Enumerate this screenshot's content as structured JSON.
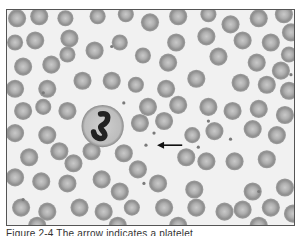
{
  "figure": {
    "type": "peripheral-blood-smear-micrograph",
    "background_color": "#f1f1f1",
    "rbc_color": "#9a9a9a",
    "rbc_center_color": "#c8c8c8",
    "nucleus_color": "#222222",
    "arrow": {
      "from": [
        174,
        134
      ],
      "to": [
        149,
        134
      ],
      "color": "#111111"
    },
    "platelet_highlighted": [
      138,
      134
    ],
    "neutrophil": {
      "cx": 95,
      "cy": 115,
      "r": 21
    },
    "rbcs": [
      [
        10,
        8,
        9
      ],
      [
        32,
        6,
        9
      ],
      [
        58,
        8,
        8
      ],
      [
        90,
        6,
        8
      ],
      [
        118,
        4,
        8
      ],
      [
        142,
        12,
        9
      ],
      [
        170,
        6,
        9
      ],
      [
        200,
        4,
        8
      ],
      [
        222,
        14,
        9
      ],
      [
        250,
        8,
        9
      ],
      [
        275,
        4,
        9
      ],
      [
        8,
        32,
        8
      ],
      [
        28,
        30,
        9
      ],
      [
        62,
        28,
        9
      ],
      [
        87,
        40,
        9
      ],
      [
        112,
        32,
        8
      ],
      [
        168,
        32,
        9
      ],
      [
        198,
        26,
        9
      ],
      [
        234,
        30,
        9
      ],
      [
        262,
        32,
        9
      ],
      [
        282,
        22,
        9
      ],
      [
        16,
        56,
        9
      ],
      [
        44,
        54,
        9
      ],
      [
        60,
        44,
        8
      ],
      [
        135,
        45,
        8
      ],
      [
        160,
        52,
        9
      ],
      [
        210,
        46,
        9
      ],
      [
        248,
        52,
        9
      ],
      [
        272,
        60,
        9
      ],
      [
        280,
        44,
        8
      ],
      [
        8,
        78,
        9
      ],
      [
        40,
        78,
        9
      ],
      [
        75,
        70,
        9
      ],
      [
        104,
        70,
        9
      ],
      [
        128,
        74,
        8
      ],
      [
        158,
        78,
        9
      ],
      [
        188,
        68,
        9
      ],
      [
        232,
        72,
        9
      ],
      [
        258,
        74,
        9
      ],
      [
        280,
        80,
        9
      ],
      [
        16,
        100,
        9
      ],
      [
        36,
        96,
        8
      ],
      [
        60,
        100,
        9
      ],
      [
        140,
        96,
        9
      ],
      [
        170,
        94,
        9
      ],
      [
        200,
        96,
        9
      ],
      [
        224,
        100,
        9
      ],
      [
        250,
        98,
        9
      ],
      [
        276,
        104,
        9
      ],
      [
        8,
        122,
        9
      ],
      [
        40,
        124,
        9
      ],
      [
        132,
        112,
        9
      ],
      [
        156,
        110,
        9
      ],
      [
        184,
        124,
        8
      ],
      [
        206,
        120,
        9
      ],
      [
        244,
        118,
        9
      ],
      [
        268,
        124,
        9
      ],
      [
        22,
        146,
        9
      ],
      [
        52,
        140,
        9
      ],
      [
        66,
        152,
        9
      ],
      [
        84,
        140,
        9
      ],
      [
        116,
        142,
        9
      ],
      [
        130,
        158,
        9
      ],
      [
        178,
        146,
        9
      ],
      [
        198,
        150,
        9
      ],
      [
        226,
        150,
        9
      ],
      [
        258,
        148,
        9
      ],
      [
        8,
        166,
        9
      ],
      [
        34,
        170,
        9
      ],
      [
        60,
        172,
        9
      ],
      [
        94,
        168,
        9
      ],
      [
        112,
        180,
        9
      ],
      [
        150,
        172,
        9
      ],
      [
        186,
        178,
        9
      ],
      [
        244,
        180,
        9
      ],
      [
        276,
        176,
        9
      ],
      [
        14,
        196,
        9
      ],
      [
        40,
        200,
        9
      ],
      [
        72,
        196,
        9
      ],
      [
        96,
        200,
        9
      ],
      [
        124,
        196,
        8
      ],
      [
        156,
        196,
        9
      ],
      [
        188,
        196,
        9
      ],
      [
        216,
        200,
        9
      ],
      [
        234,
        198,
        9
      ],
      [
        262,
        196,
        9
      ],
      [
        284,
        202,
        9
      ],
      [
        30,
        214,
        9
      ],
      [
        110,
        214,
        9
      ],
      [
        170,
        214,
        9
      ],
      [
        250,
        214,
        9
      ]
    ],
    "platelets": [
      [
        104,
        36
      ],
      [
        36,
        82
      ],
      [
        116,
        92
      ],
      [
        146,
        122
      ],
      [
        200,
        110
      ],
      [
        282,
        64
      ],
      [
        222,
        128
      ],
      [
        136,
        172
      ],
      [
        250,
        180
      ],
      [
        16,
        188
      ],
      [
        190,
        136
      ]
    ]
  },
  "caption": {
    "text": "Figure 2-4  The arrow indicates a platelet"
  }
}
